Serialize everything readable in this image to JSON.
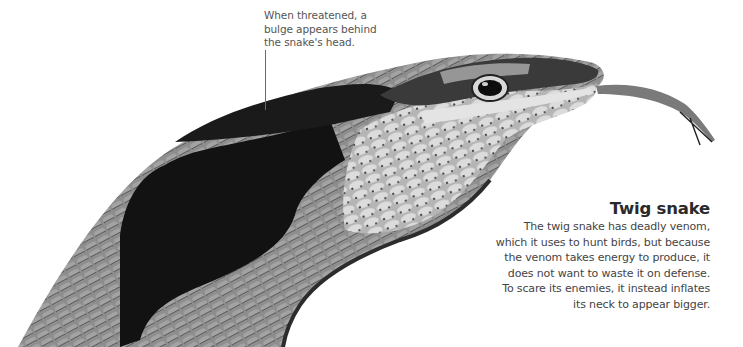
{
  "callout": {
    "lines": [
      "When threatened, a",
      "bulge appears behind",
      "the snake's head."
    ]
  },
  "info": {
    "title": "Twig snake",
    "lines": [
      "The twig snake has deadly venom,",
      "which it uses to hunt birds, but because",
      "the venom takes energy to produce, it",
      "does not want to waste it on defense.",
      "To scare its enemies, it instead inflates",
      "its neck to appear bigger."
    ]
  },
  "image": {
    "subject": "twig-snake-head-photo",
    "colors": {
      "dark_patch": "#111111",
      "mid_scale": "#8a8a8a",
      "light_scale": "#d4d4d4",
      "tongue": "#6e6e6e"
    }
  }
}
